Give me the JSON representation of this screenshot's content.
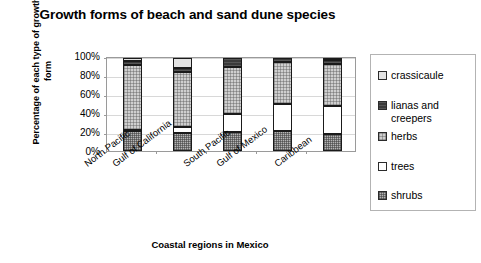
{
  "chart_data": {
    "type": "bar",
    "subtype": "stacked-percent-column",
    "title": "Growth forms of beach and sand dune species",
    "xlabel": "Coastal regions in Mexico",
    "ylabel": "Percentage of each type of growth form",
    "categories": [
      "North Pacific",
      "Gulf of California",
      "South Pacific",
      "Gulf of Mexico",
      "Caribbean"
    ],
    "ylim": [
      0,
      100
    ],
    "ytick_labels": [
      "100%",
      "80%",
      "60%",
      "40%",
      "20%",
      "0%"
    ],
    "ytick_values": [
      100,
      80,
      60,
      40,
      20,
      0
    ],
    "grid": true,
    "legend_position": "right",
    "series": [
      {
        "name": "shrubs",
        "values": [
          22,
          19,
          20,
          22,
          18
        ],
        "color": "#b5b5b5",
        "pattern": "checker"
      },
      {
        "name": "trees",
        "values": [
          1,
          7,
          20,
          29,
          30
        ],
        "color": "#ffffff",
        "pattern": "solid"
      },
      {
        "name": "herbs",
        "values": [
          69,
          59,
          50,
          45,
          46
        ],
        "color": "#cfcfcf",
        "pattern": "fine-checker"
      },
      {
        "name": "lianas and creepers",
        "values": [
          5,
          4,
          10,
          4,
          4
        ],
        "color": "#3a3a3a",
        "pattern": "dark"
      },
      {
        "name": "crassicaule",
        "values": [
          3,
          11,
          0,
          0,
          2
        ],
        "color": "#e3e3e3",
        "pattern": "light"
      }
    ],
    "legend_entries": [
      {
        "label": "crassicaule",
        "color": "#e3e3e3"
      },
      {
        "label": "lianas and\ncreepers",
        "color": "#3a3a3a"
      },
      {
        "label": "herbs",
        "color": "#cfcfcf"
      },
      {
        "label": "trees",
        "color": "#ffffff"
      },
      {
        "label": "shrubs",
        "color": "#b5b5b5"
      }
    ]
  }
}
